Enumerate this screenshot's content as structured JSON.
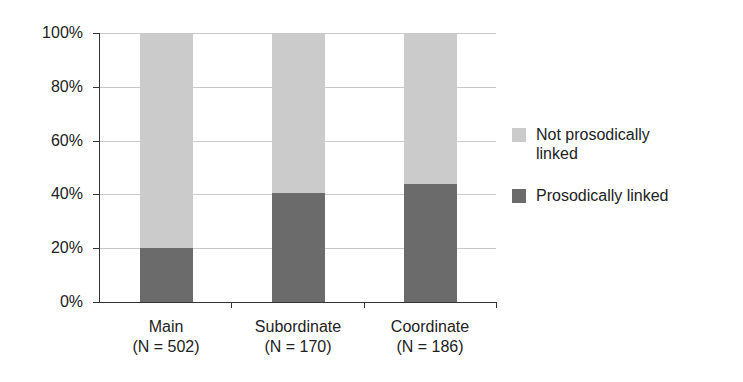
{
  "chart_data": {
    "type": "bar",
    "stacked": true,
    "percent": true,
    "title": "",
    "xlabel": "",
    "ylabel": "",
    "ylim": [
      0,
      100
    ],
    "yticks": [
      "0%",
      "20%",
      "40%",
      "60%",
      "80%",
      "100%"
    ],
    "grid": true,
    "legend_position": "right",
    "categories": [
      "Main",
      "Subordinate",
      "Coordinate"
    ],
    "category_counts": [
      "(N = 502)",
      "(N = 170)",
      "(N = 186)"
    ],
    "series": [
      {
        "name": "Prosodically linked",
        "color": "#6b6b6b",
        "values": [
          20,
          40.5,
          44
        ]
      },
      {
        "name": "Not prosodically linked",
        "color": "#cbcbcb",
        "values": [
          80,
          59.5,
          56
        ]
      }
    ]
  },
  "legend": {
    "items": [
      {
        "label_line1": "Not prosodically",
        "label_line2": "linked",
        "color": "#cbcbcb"
      },
      {
        "label_line1": "Prosodically linked",
        "label_line2": "",
        "color": "#6b6b6b"
      }
    ]
  }
}
